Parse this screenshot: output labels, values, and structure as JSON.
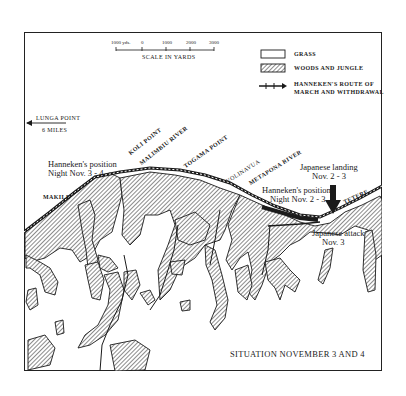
{
  "scale": {
    "ticks": [
      "1000 yds.",
      "0",
      "1000",
      "2000",
      "3000"
    ],
    "label": "SCALE IN YARDS"
  },
  "legend": {
    "items": [
      {
        "symbol": "empty-box",
        "label": "GRASS"
      },
      {
        "symbol": "hatched-box",
        "label": "WOODS AND JUNGLE"
      },
      {
        "symbol": "route-line",
        "label": "HANNEKEN'S ROUTE OF",
        "label2": "MARCH AND WITHDRAWAL"
      }
    ]
  },
  "place_labels": {
    "lunga_point": "LUNGA POINT",
    "lunga_distance": "6 MILES",
    "koli_point": "KOLI POINT",
    "malimbiu_river": "MALIMBIU RIVER",
    "togama_point": "TOGAMA POINT",
    "volinavua": "VOLINAVUA",
    "metapona_river": "METAPONA RIVER",
    "makile": "MAKILE",
    "tetere": "TETERE"
  },
  "annotations": {
    "hanneken_34_line1": "Hanneken's position",
    "hanneken_34_line2": "Night Nov. 3 - 4",
    "hanneken_23_line1": "Hanneken's position",
    "hanneken_23_line2": "Night Nov. 2 - 3",
    "jap_landing_line1": "Japanese landing",
    "jap_landing_line2": "Nov. 2 - 3",
    "jap_attack_line1": "Japanese attack",
    "jap_attack_line2": "Nov. 3"
  },
  "title": "SITUATION NOVEMBER 3 AND 4",
  "colors": {
    "ink": "#1a1a1a",
    "paper": "#ffffff"
  }
}
